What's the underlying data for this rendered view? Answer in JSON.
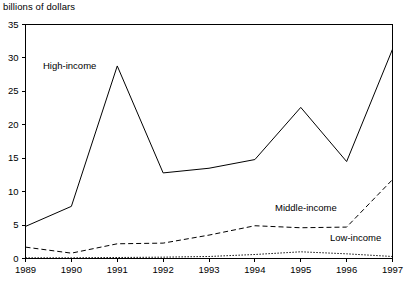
{
  "chart_data": {
    "type": "line",
    "title": "",
    "subtitle": "",
    "xlabel": "",
    "ylabel": "billions of dollars",
    "ylim": [
      0,
      35
    ],
    "yticks": [
      0,
      5,
      10,
      15,
      20,
      25,
      30,
      35
    ],
    "ytick_labels": [
      "0",
      "5",
      "10",
      "15",
      "20",
      "25",
      "30",
      "35"
    ],
    "x": [
      1989,
      1990,
      1991,
      1992,
      1993,
      1994,
      1995,
      1996,
      1997
    ],
    "categories": [
      "1989",
      "1990",
      "1991",
      "1992",
      "1993",
      "1994",
      "1995",
      "1996",
      "1997"
    ],
    "xtick_labels": [
      "1989",
      "1990",
      "1991",
      "1992",
      "1993",
      "1994",
      "1995",
      "1996",
      "1997"
    ],
    "grid": false,
    "legend_position": "inline-annotations",
    "series": [
      {
        "name": "High-income",
        "style": "solid",
        "color": "#000000",
        "values": [
          4.8,
          7.8,
          28.8,
          12.8,
          13.5,
          14.8,
          22.6,
          14.5,
          31.3
        ]
      },
      {
        "name": "Middle-income",
        "style": "dashed",
        "color": "#000000",
        "values": [
          1.7,
          0.8,
          2.2,
          2.3,
          3.5,
          4.9,
          4.6,
          4.7,
          11.8
        ]
      },
      {
        "name": "Low-income",
        "style": "dotted",
        "color": "#000000",
        "values": [
          0.1,
          0.1,
          0.15,
          0.2,
          0.3,
          0.6,
          1.0,
          0.7,
          0.3
        ]
      }
    ],
    "annotations": [
      {
        "text": "High-income",
        "series": "High-income"
      },
      {
        "text": "Middle-income",
        "series": "Middle-income"
      },
      {
        "text": "Low-income",
        "series": "Low-income"
      }
    ]
  },
  "axis": {
    "y_title": "billions of dollars"
  }
}
